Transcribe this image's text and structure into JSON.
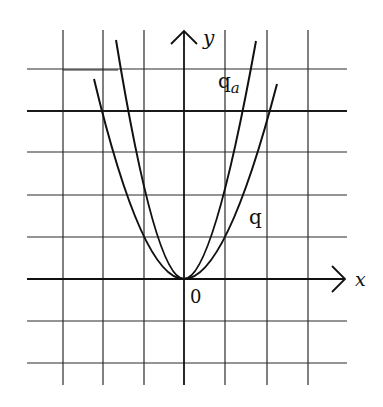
{
  "figure": {
    "type": "diagram",
    "axes": {
      "x_label": "x",
      "y_label": "y",
      "origin_label": "0"
    },
    "curves": [
      {
        "name": "q",
        "label": "q",
        "equation_estimate": "y = x^2"
      },
      {
        "name": "q_a",
        "label": "q",
        "subscript": "a",
        "equation_estimate": "y = a·x^2, a ≈ 2"
      }
    ],
    "grid": {
      "x_range_units": [
        -3,
        3
      ],
      "y_range_units": [
        -2,
        5
      ],
      "cell_size_px": 41.5
    },
    "colors": {
      "background": "#ffffff",
      "ink": "#111111"
    }
  }
}
